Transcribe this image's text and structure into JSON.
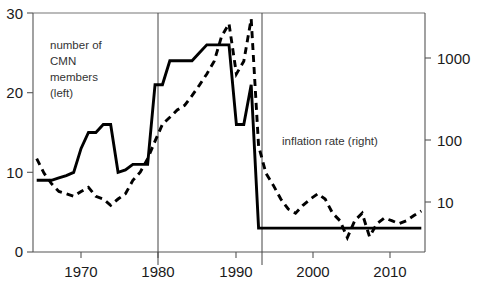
{
  "chart_data": {
    "type": "line",
    "title": "",
    "xlabel": "",
    "ylabel": "",
    "grid": false,
    "legend_position": "inline-annotations",
    "xlim": [
      1963.5,
      2016.5
    ],
    "x_ticks": [
      1970,
      1980,
      1990,
      2000,
      2010
    ],
    "x_tick_labels": [
      "1970",
      "1980",
      "1990",
      "2000",
      "2010"
    ],
    "left_axis": {
      "label": "number of CMN members",
      "scale": "linear",
      "ylim": [
        0,
        30
      ],
      "ticks": [
        0,
        10,
        20,
        30
      ],
      "tick_labels": [
        "0",
        "10",
        "20",
        "30"
      ]
    },
    "right_axis": {
      "label": "inflation rate",
      "scale": "log",
      "ylim": [
        3.0,
        5000
      ],
      "ticks": [
        10,
        100,
        1000
      ],
      "tick_labels": [
        "10",
        "100",
        "1000"
      ]
    },
    "annotations": [
      {
        "name": "left-series-label",
        "text": "number of\nCMN\nmembers\n(left)",
        "x": 1968.5,
        "y": 26.5
      },
      {
        "name": "right-series-label",
        "text": "inflation rate (right)",
        "x": 1995.0,
        "y": 11.5
      }
    ],
    "reference_lines": [
      {
        "name": "vline-1980",
        "x": 1980
      },
      {
        "name": "vline-1994",
        "x": 1993.5
      }
    ],
    "series": [
      {
        "name": "number of CMN members",
        "axis": "left",
        "style": "solid",
        "x": [
          1964,
          1965,
          1966,
          1967,
          1968,
          1969,
          1970,
          1971,
          1972,
          1973,
          1974,
          1975,
          1976,
          1977,
          1978,
          1979,
          1980,
          1981,
          1982,
          1983,
          1984,
          1985,
          1986,
          1987,
          1988,
          1989,
          1990,
          1991,
          1992,
          1993,
          1994,
          1995,
          1996,
          1997,
          1998,
          1999,
          2000,
          2001,
          2002,
          2003,
          2004,
          2005,
          2006,
          2007,
          2008,
          2009,
          2010,
          2011,
          2012,
          2013,
          2014,
          2015,
          2016
        ],
        "values": [
          9,
          9,
          9,
          9.3,
          9.6,
          10,
          13,
          15,
          15,
          16,
          16,
          10,
          10.3,
          11,
          11,
          11,
          21,
          21,
          24,
          24,
          24,
          24,
          25,
          26,
          26,
          26,
          26,
          16,
          16,
          21,
          3,
          3,
          3,
          3,
          3,
          3,
          3,
          3,
          3,
          3,
          3,
          3,
          3,
          3,
          3,
          3,
          3,
          3,
          3,
          3,
          3,
          3,
          3
        ]
      },
      {
        "name": "inflation rate",
        "axis": "right",
        "style": "dashed",
        "x": [
          1964,
          1965,
          1966,
          1967,
          1968,
          1969,
          1970,
          1971,
          1972,
          1973,
          1974,
          1975,
          1976,
          1977,
          1978,
          1979,
          1980,
          1981,
          1982,
          1983,
          1984,
          1985,
          1986,
          1987,
          1988,
          1989,
          1990,
          1991,
          1992,
          1993,
          1994,
          1995,
          1996,
          1997,
          1998,
          1999,
          2000,
          2001,
          2002,
          2003,
          2004,
          2005,
          2006,
          2007,
          2008,
          2009,
          2010,
          2011,
          2012,
          2013,
          2014,
          2015,
          2016
        ],
        "values": [
          40,
          25,
          18,
          14,
          13,
          12,
          14,
          16,
          12,
          11,
          9,
          11,
          13,
          20,
          26,
          40,
          70,
          120,
          150,
          190,
          220,
          300,
          420,
          600,
          900,
          2000,
          3000,
          600,
          900,
          3500,
          60,
          25,
          17,
          11,
          8,
          7,
          9,
          11,
          13,
          11,
          7,
          5.5,
          3.2,
          5.5,
          7,
          3.3,
          5,
          6,
          5.5,
          5,
          5.5,
          6.5,
          7.5
        ]
      }
    ]
  }
}
